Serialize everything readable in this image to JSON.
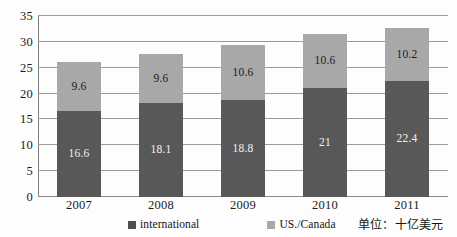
{
  "chart_data": {
    "type": "bar",
    "subtype": "stacked-column",
    "title": "",
    "xlabel": "",
    "ylabel": "",
    "ylim": [
      0,
      35
    ],
    "ytick_step": 5,
    "ytick_labels": [
      "0",
      "5",
      "10",
      "15",
      "20",
      "25",
      "30",
      "35"
    ],
    "ytick_values": [
      0,
      5,
      10,
      15,
      20,
      25,
      30,
      35
    ],
    "grid": true,
    "grid_axis": "y",
    "categories": [
      "2007",
      "2008",
      "2009",
      "2010",
      "2011"
    ],
    "series": [
      {
        "name": "international",
        "color": "#585858",
        "values": [
          16.6,
          18.1,
          18.8,
          21,
          22.4
        ],
        "labels": [
          "16.6",
          "18.1",
          "18.8",
          "21",
          "22.4"
        ]
      },
      {
        "name": "US./Canada",
        "color": "#a8a8a8",
        "values": [
          9.6,
          9.6,
          10.6,
          10.6,
          10.2
        ],
        "labels": [
          "9.6",
          "9.6",
          "10.6",
          "10.6",
          "10.2"
        ]
      }
    ],
    "totals": [
      26.2,
      27.7,
      29.4,
      31.6,
      32.6
    ],
    "legend": {
      "position": "bottom",
      "entries": [
        {
          "label": "international",
          "color": "#585858"
        },
        {
          "label": "US./Canada",
          "color": "#a8a8a8"
        }
      ]
    },
    "annotations": {
      "unit_note": "单位：十亿美元"
    }
  }
}
